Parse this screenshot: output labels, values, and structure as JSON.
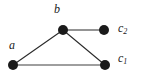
{
  "diagram": {
    "type": "graph",
    "width": 145,
    "height": 76,
    "background_color": "#ffffff",
    "nodes": [
      {
        "id": "a",
        "label": "a",
        "cx": 13,
        "cy": 65,
        "r": 5,
        "color": "#1a1a1a"
      },
      {
        "id": "b",
        "label": "b",
        "cx": 63,
        "cy": 30,
        "r": 5,
        "color": "#1a1a1a"
      },
      {
        "id": "c2",
        "label": "c",
        "sub": "2",
        "cx": 104,
        "cy": 30,
        "r": 5,
        "color": "#1a1a1a"
      },
      {
        "id": "c1",
        "label": "c",
        "sub": "1",
        "cx": 105,
        "cy": 65,
        "r": 5,
        "color": "#1a1a1a"
      }
    ],
    "edges": [
      {
        "id": "edge-a-b",
        "from": "a",
        "to": "b",
        "color": "#2b2b2b",
        "width": 1.1
      },
      {
        "id": "edge-b-c2",
        "from": "b",
        "to": "c2",
        "color": "#2b2b2b",
        "width": 1.1
      },
      {
        "id": "edge-b-c1",
        "from": "b",
        "to": "c1",
        "color": "#2b2b2b",
        "width": 1.1
      },
      {
        "id": "edge-a-c1",
        "from": "a",
        "to": "c1",
        "color": "#9e9e9e",
        "width": 2.0
      }
    ],
    "labels": {
      "b": "b",
      "a": "a",
      "c2_base": "c",
      "c2_sub": "2",
      "c1_base": "c",
      "c1_sub": "1"
    }
  }
}
